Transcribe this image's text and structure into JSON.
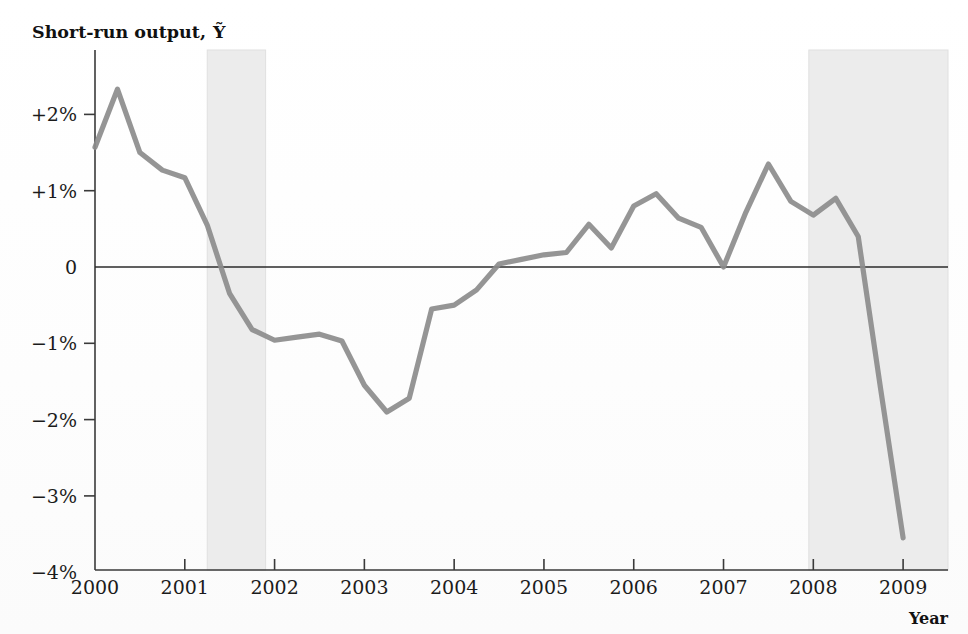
{
  "figure": {
    "y_axis_title": "Short-run output,",
    "y_axis_symbol": "Ỹ",
    "x_axis_title": "Year",
    "background_color": "#ffffff",
    "line_color": "#8c8c8c",
    "band_color": "#ececec",
    "axis_color": "#3a3a3a",
    "zero_line_color": "#2b2b2b"
  },
  "chart_data": {
    "type": "line",
    "title": "Short-run output, Ỹ",
    "xlabel": "Year",
    "ylabel": "Short-run output, Ỹ",
    "xlim": [
      2000.0,
      2009.5
    ],
    "ylim": [
      -4,
      2.6
    ],
    "grid": false,
    "legend": null,
    "y_tick_labels": [
      "+2%",
      "+1%",
      "0",
      "-1%",
      "-2%",
      "-3%",
      "-4%"
    ],
    "y_tick_values": [
      2,
      1,
      0,
      -1,
      -2,
      -3,
      -4
    ],
    "x_tick_labels": [
      "2000",
      "2001",
      "2002",
      "2003",
      "2004",
      "2005",
      "2006",
      "2007",
      "2008",
      "2009"
    ],
    "x_tick_values": [
      2000,
      2001,
      2002,
      2003,
      2004,
      2005,
      2006,
      2007,
      2008,
      2009
    ],
    "shaded_bands": [
      {
        "name": "recession-2001",
        "start": 2001.25,
        "end": 2001.9
      },
      {
        "name": "recession-2008",
        "start": 2007.95,
        "end": 2009.5
      }
    ],
    "series": [
      {
        "name": "Short-run output",
        "color": "#8c8c8c",
        "x": [
          2000.0,
          2000.25,
          2000.5,
          2000.75,
          2001.0,
          2001.25,
          2001.5,
          2001.75,
          2002.0,
          2002.25,
          2002.5,
          2002.75,
          2003.0,
          2003.25,
          2003.5,
          2003.75,
          2004.0,
          2004.25,
          2004.5,
          2004.75,
          2005.0,
          2005.25,
          2005.5,
          2005.75,
          2006.0,
          2006.25,
          2006.5,
          2006.75,
          2007.0,
          2007.25,
          2007.5,
          2007.75,
          2008.0,
          2008.25,
          2008.5,
          2008.75,
          2009.0
        ],
        "y": [
          1.57,
          2.33,
          1.5,
          1.27,
          1.17,
          0.55,
          -0.35,
          -0.82,
          -0.96,
          -0.92,
          -0.88,
          -0.97,
          -1.55,
          -1.9,
          -1.72,
          -0.55,
          -0.5,
          -0.3,
          0.04,
          0.1,
          0.16,
          0.19,
          0.56,
          0.25,
          0.8,
          0.96,
          0.64,
          0.52,
          0.0,
          0.72,
          1.35,
          0.86,
          0.68,
          0.9,
          0.4,
          -1.6,
          -3.55
        ]
      }
    ]
  }
}
